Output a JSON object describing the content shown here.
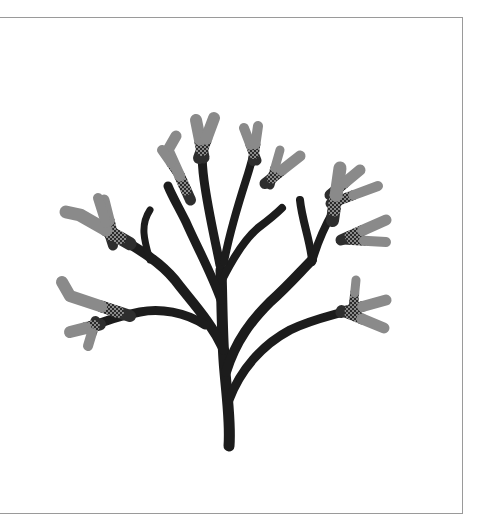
{
  "figure": {
    "colors": {
      "background": "#ffffff",
      "frame_border": "#9a9a9a",
      "stem_dark": "#1c1c1c",
      "branch_mid": "#2e2e2e",
      "tip_gray": "#8a8a8a"
    },
    "frame": {
      "x": -2,
      "y": 17,
      "width": 465,
      "height": 497
    },
    "dark_branches": [
      {
        "d": "M229 446 C231 420 226 390 224 360 C222 330 222 300 221 270",
        "w": 11
      },
      {
        "d": "M224 350 C210 320 190 300 175 280 C160 262 140 250 120 238",
        "w": 10
      },
      {
        "d": "M226 372 C236 340 252 320 270 302 C288 286 300 272 312 260",
        "w": 10
      },
      {
        "d": "M229 400 C240 370 262 345 290 330 C310 320 330 316 350 310",
        "w": 9
      },
      {
        "d": "M221 300 C210 270 196 245 186 222 C178 206 172 196 168 186",
        "w": 9
      },
      {
        "d": "M222 280 C232 260 244 240 258 228 C266 222 274 216 282 208",
        "w": 8
      },
      {
        "d": "M205 325 C185 312 160 308 140 312 C120 316 106 320 94 326",
        "w": 9
      },
      {
        "d": "M150 260 C144 240 140 225 150 210",
        "w": 7
      },
      {
        "d": "M220 265 C214 235 208 210 204 180 C202 166 202 156 202 148",
        "w": 9
      },
      {
        "d": "M224 262 C230 230 238 205 246 180 C250 168 252 160 254 152",
        "w": 8
      },
      {
        "d": "M312 260 C310 240 302 220 300 200",
        "w": 8
      },
      {
        "d": "M312 262 C318 240 326 224 334 210",
        "w": 8
      }
    ],
    "gray_tips": [
      {
        "d": "M202 150 L196 120",
        "w": 12
      },
      {
        "d": "M202 150 L214 118",
        "w": 12
      },
      {
        "d": "M186 190 L168 150 L176 136",
        "w": 11
      },
      {
        "d": "M176 170 L162 150",
        "w": 10
      },
      {
        "d": "M254 154 L244 128",
        "w": 10
      },
      {
        "d": "M254 154 L258 126",
        "w": 10
      },
      {
        "d": "M272 178 L280 150",
        "w": 9
      },
      {
        "d": "M272 178 L300 156",
        "w": 11
      },
      {
        "d": "M120 238 L80 215 L66 212",
        "w": 13
      },
      {
        "d": "M112 232 L104 200",
        "w": 11
      },
      {
        "d": "M110 236 L98 198",
        "w": 10
      },
      {
        "d": "M94 326 L70 332",
        "w": 12
      },
      {
        "d": "M118 312 L70 296 L62 282",
        "w": 12
      },
      {
        "d": "M94 326 L88 346",
        "w": 10
      },
      {
        "d": "M334 210 L340 168",
        "w": 13
      },
      {
        "d": "M336 190 L360 170",
        "w": 11
      },
      {
        "d": "M340 200 L378 186",
        "w": 10
      },
      {
        "d": "M350 236 L386 220",
        "w": 11
      },
      {
        "d": "M352 240 L386 242",
        "w": 10
      },
      {
        "d": "M350 310 L386 300",
        "w": 11
      },
      {
        "d": "M350 314 L384 328",
        "w": 11
      },
      {
        "d": "M354 300 L356 280",
        "w": 9
      }
    ]
  }
}
